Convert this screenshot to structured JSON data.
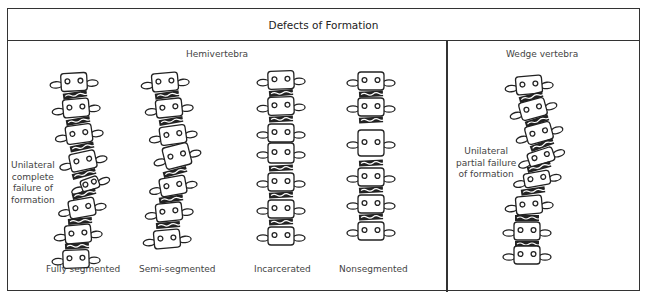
{
  "title": "Defects of Formation",
  "sections": {
    "hemivertebra": {
      "heading": "Hemivertebra",
      "side_label": [
        "Unilateral",
        "complete",
        "failure of",
        "formation"
      ],
      "columns": [
        {
          "label": "Fully segmented"
        },
        {
          "label": "Semi-segmented"
        },
        {
          "label": "Incarcerated"
        },
        {
          "label": "Nonsegmented"
        }
      ]
    },
    "wedge": {
      "heading": "Wedge vertebra",
      "side_label": [
        "Unilateral",
        "partial failure",
        "of formation"
      ]
    }
  },
  "colors": {
    "line": "#222222",
    "border": "#333333",
    "text": "#444444"
  }
}
